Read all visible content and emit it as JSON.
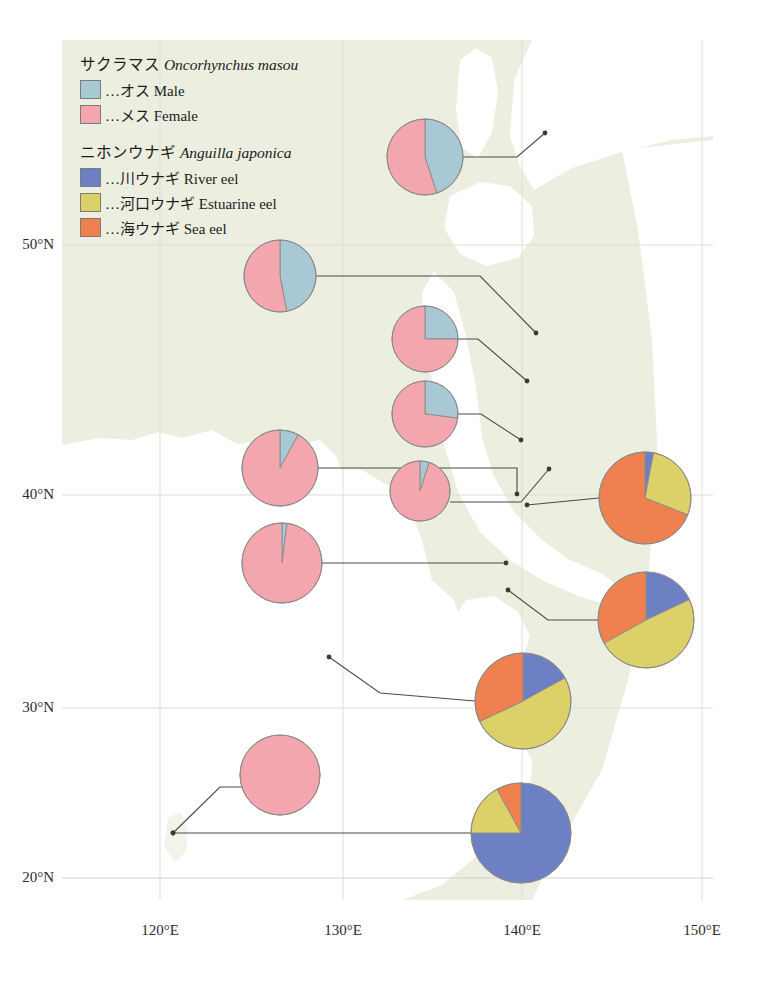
{
  "figure": {
    "type": "map-pie-chart",
    "background_sea_color": "#eceee0",
    "land_color": "#ffffff"
  },
  "legend": {
    "groups": [
      {
        "name": "masu-salmon",
        "title_jp": "サクラマス",
        "title_sci": "Oncorhynchus masou",
        "items": [
          {
            "key": "male",
            "label": "…オス Male",
            "color": "#a8c9d4"
          },
          {
            "key": "female",
            "label": "…メス Female",
            "color": "#f4a6ae"
          }
        ]
      },
      {
        "name": "japanese-eel",
        "title_jp": "ニホンウナギ",
        "title_sci": "Anguilla japonica",
        "items": [
          {
            "key": "river",
            "label": "…川ウナギ River eel",
            "color": "#6d80c3"
          },
          {
            "key": "estuarine",
            "label": "…河口ウナギ Estuarine eel",
            "color": "#dcd069"
          },
          {
            "key": "sea",
            "label": "…海ウナギ Sea eel",
            "color": "#ef8050"
          }
        ]
      }
    ]
  },
  "axes": {
    "latitude": {
      "unit": "°N",
      "ticks": [
        {
          "value": 50,
          "label": "50°N",
          "y": 245
        },
        {
          "value": 40,
          "label": "40°N",
          "y": 495
        },
        {
          "value": 30,
          "label": "30°N",
          "y": 708
        },
        {
          "value": 20,
          "label": "20°N",
          "y": 878
        }
      ]
    },
    "longitude": {
      "unit": "°E",
      "ticks": [
        {
          "value": 120,
          "label": "120°E",
          "x": 160
        },
        {
          "value": 130,
          "label": "130°E",
          "x": 343
        },
        {
          "value": 140,
          "label": "140°E",
          "x": 522
        },
        {
          "value": 150,
          "label": "150°E",
          "x": 702
        }
      ]
    }
  },
  "chart_data": {
    "type": "pie",
    "title": "",
    "series_groups": [
      {
        "group": "masu-salmon",
        "categories": [
          "Male",
          "Female"
        ],
        "colors": [
          "#a8c9d4",
          "#f4a6ae"
        ],
        "pies": [
          {
            "id": "masu-1",
            "cx": 425,
            "cy": 157,
            "r": 38,
            "values": [
              45,
              55
            ],
            "site_x": 545,
            "site_y": 133
          },
          {
            "id": "masu-2",
            "cx": 280,
            "cy": 276,
            "r": 36,
            "values": [
              47,
              53
            ],
            "site_x": 536,
            "site_y": 333
          },
          {
            "id": "masu-3",
            "cx": 425,
            "cy": 339,
            "r": 33,
            "values": [
              25,
              75
            ],
            "site_x": 527,
            "site_y": 381
          },
          {
            "id": "masu-4",
            "cx": 425,
            "cy": 414,
            "r": 33,
            "values": [
              27,
              73
            ],
            "site_x": 521,
            "site_y": 440
          },
          {
            "id": "masu-5",
            "cx": 280,
            "cy": 468,
            "r": 38,
            "values": [
              8,
              92
            ],
            "site_x": 517,
            "site_y": 494
          },
          {
            "id": "masu-6",
            "cx": 420,
            "cy": 491,
            "r": 30,
            "values": [
              5,
              95
            ],
            "site_x": 549,
            "site_y": 469
          },
          {
            "id": "masu-7",
            "cx": 282,
            "cy": 563,
            "r": 40,
            "values": [
              2,
              98
            ],
            "site_x": 506,
            "site_y": 563
          },
          {
            "id": "masu-8",
            "cx": 280,
            "cy": 775,
            "r": 40,
            "values": [
              0,
              100
            ],
            "site_x": 173,
            "site_y": 833
          }
        ]
      },
      {
        "group": "japanese-eel",
        "categories": [
          "River eel",
          "Estuarine eel",
          "Sea eel"
        ],
        "colors": [
          "#6d80c3",
          "#dcd069",
          "#ef8050"
        ],
        "pies": [
          {
            "id": "eel-1",
            "cx": 645,
            "cy": 498,
            "r": 46,
            "values": [
              3,
              28,
              69
            ],
            "site_x": 527,
            "site_y": 505
          },
          {
            "id": "eel-2",
            "cx": 646,
            "cy": 620,
            "r": 48,
            "values": [
              18,
              49,
              33
            ],
            "site_x": 508,
            "site_y": 590
          },
          {
            "id": "eel-3",
            "cx": 523,
            "cy": 701,
            "r": 48,
            "values": [
              17,
              51,
              32
            ],
            "site_x": 329,
            "site_y": 657
          },
          {
            "id": "eel-4",
            "cx": 521,
            "cy": 833,
            "r": 50,
            "values": [
              75,
              17,
              8
            ],
            "site_x": 173,
            "site_y": 833
          }
        ]
      }
    ]
  }
}
